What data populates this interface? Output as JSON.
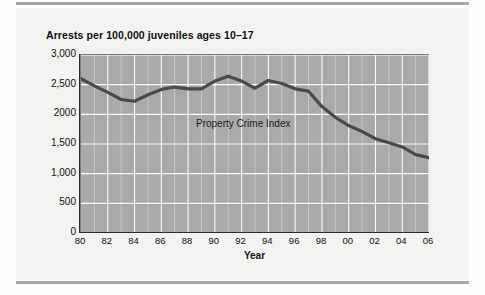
{
  "figure": {
    "title": "Arrests per 100,000 juveniles ages 10–17",
    "series_label": "Property Crime Index",
    "xaxis_title": "Year"
  },
  "chart_data": {
    "type": "line",
    "title": "Arrests per 100,000 juveniles ages 10–17",
    "xlabel": "Year",
    "ylabel": "",
    "xlim": [
      1980,
      2006
    ],
    "ylim": [
      0,
      3000
    ],
    "grid": true,
    "legend": "none",
    "annotations": [
      "Property Crime Index"
    ],
    "ytick_labels": [
      "3,000",
      "2,500",
      "2000",
      "1,500",
      "1,000",
      "500",
      "0"
    ],
    "ytick_values": [
      3000,
      2500,
      2000,
      1500,
      1000,
      500,
      0
    ],
    "xtick_labels": [
      "80",
      "82",
      "84",
      "86",
      "88",
      "90",
      "92",
      "94",
      "96",
      "98",
      "00",
      "02",
      "04",
      "06"
    ],
    "xtick_values": [
      1980,
      1982,
      1984,
      1986,
      1988,
      1990,
      1992,
      1994,
      1996,
      1998,
      2000,
      2002,
      2004,
      2006
    ],
    "series": [
      {
        "name": "Property Crime Index",
        "color": "#4a4a4a",
        "x": [
          1980,
          1981,
          1982,
          1983,
          1984,
          1985,
          1986,
          1987,
          1988,
          1989,
          1990,
          1991,
          1992,
          1993,
          1994,
          1995,
          1996,
          1997,
          1998,
          1999,
          2000,
          2001,
          2002,
          2003,
          2004,
          2005,
          2006
        ],
        "values": [
          2600,
          2480,
          2370,
          2250,
          2220,
          2330,
          2420,
          2460,
          2430,
          2430,
          2560,
          2640,
          2560,
          2440,
          2570,
          2520,
          2430,
          2390,
          2130,
          1950,
          1810,
          1710,
          1590,
          1520,
          1450,
          1320,
          1270
        ]
      }
    ]
  }
}
